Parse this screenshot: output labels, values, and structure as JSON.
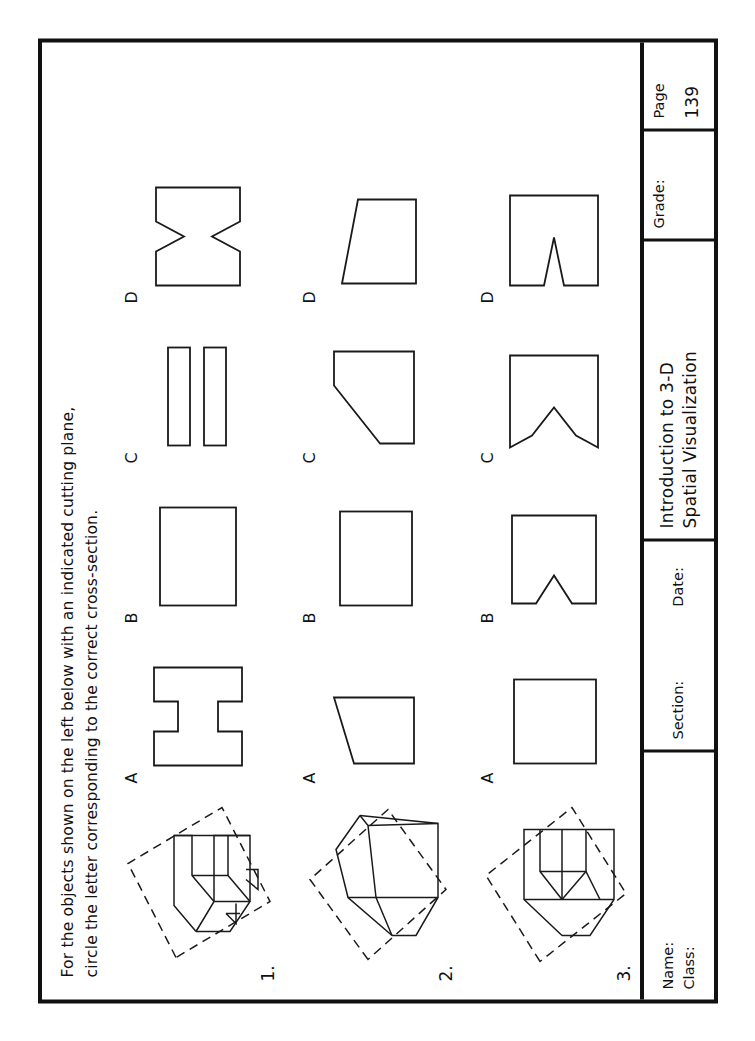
{
  "worksheet": {
    "instructions": "For the objects shown on the left below with an indicated cutting plane,\ncircle the letter corresponding to the correct cross-section.",
    "choice_letters": [
      "A",
      "B",
      "C",
      "D"
    ],
    "problems": [
      {
        "number": "1.",
        "object_description": "isometric block with rectangular through-slot and notched base, inclined cutting plane",
        "choices": [
          {
            "letter": "A",
            "shape": "h-shape"
          },
          {
            "letter": "B",
            "shape": "rectangle"
          },
          {
            "letter": "C",
            "shape": "two-parallel-bars"
          },
          {
            "letter": "D",
            "shape": "bowtie-hourglass"
          }
        ]
      },
      {
        "number": "2.",
        "object_description": "isometric wedge / truncated prism block with inclined cutting plane",
        "choices": [
          {
            "letter": "A",
            "shape": "trapezoid-bevel-top-right"
          },
          {
            "letter": "B",
            "shape": "rectangle"
          },
          {
            "letter": "C",
            "shape": "trapezoid-long-bevel-left"
          },
          {
            "letter": "D",
            "shape": "trapezoid-bevel-top-left"
          }
        ]
      },
      {
        "number": "3.",
        "object_description": "isometric block with V-groove notch and inclined cutting plane",
        "choices": [
          {
            "letter": "A",
            "shape": "square"
          },
          {
            "letter": "B",
            "shape": "rectangle-with-v-notch"
          },
          {
            "letter": "C",
            "shape": "flared-v-notch"
          },
          {
            "letter": "D",
            "shape": "deep-v-notch"
          }
        ]
      }
    ]
  },
  "title_block": {
    "name_label": "Name:",
    "class_label": "Class:",
    "section_label": "Section:",
    "date_label": "Date:",
    "title_line1": "Introduction to 3-D",
    "title_line2": "Spatial Visualization",
    "grade_label": "Grade:",
    "page_label": "Page",
    "page_number": "139"
  },
  "colors": {
    "ink": "#1a1a1a",
    "paper": "#ffffff"
  }
}
